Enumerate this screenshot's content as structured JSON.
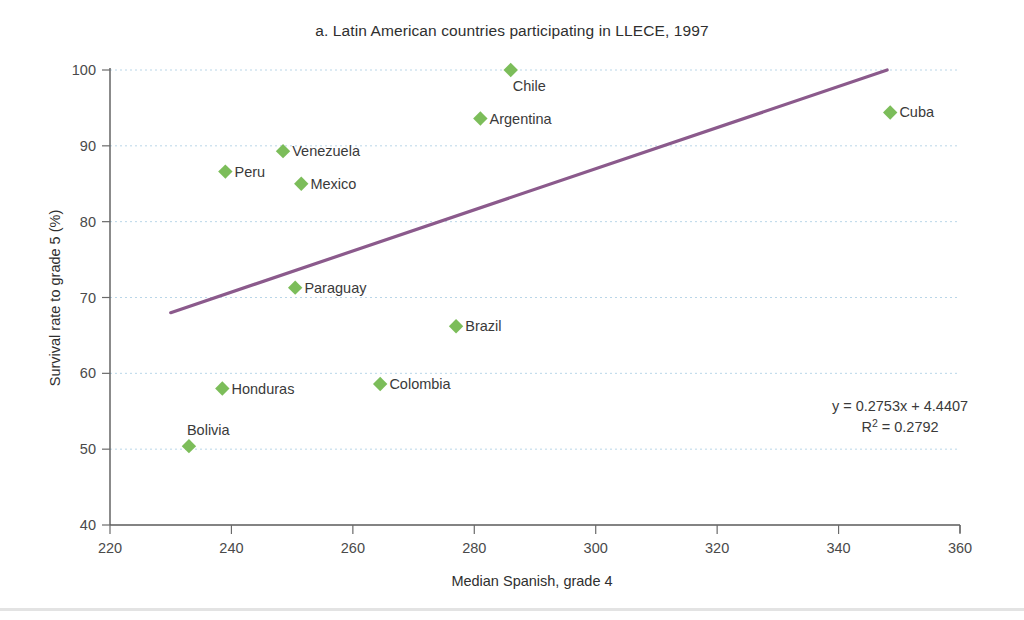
{
  "chart_data": {
    "type": "scatter",
    "title": "a. Latin American countries participating in LLECE, 1997",
    "xlabel": "Median Spanish, grade 4",
    "ylabel": "Survival rate to grade 5 (%)",
    "xlim": [
      220,
      360
    ],
    "ylim": [
      40,
      100
    ],
    "xticks": [
      220,
      240,
      260,
      280,
      300,
      320,
      340,
      360
    ],
    "yticks": [
      40,
      50,
      60,
      70,
      80,
      90,
      100
    ],
    "grid": "horizontal-dotted",
    "legend": "none",
    "marker_shape": "diamond",
    "marker_color": "#7cbd5a",
    "trendline_color": "#8b5a8c",
    "points": [
      {
        "label": "Chile",
        "x": 286.0,
        "y": 100.0,
        "label_pos": "below-right"
      },
      {
        "label": "Argentina",
        "x": 281.0,
        "y": 93.6,
        "label_pos": "right"
      },
      {
        "label": "Venezuela",
        "x": 248.5,
        "y": 89.3,
        "label_pos": "right"
      },
      {
        "label": "Peru",
        "x": 239.0,
        "y": 86.6,
        "label_pos": "right"
      },
      {
        "label": "Mexico",
        "x": 251.5,
        "y": 85.0,
        "label_pos": "right"
      },
      {
        "label": "Paraguay",
        "x": 250.5,
        "y": 71.3,
        "label_pos": "right"
      },
      {
        "label": "Brazil",
        "x": 277.0,
        "y": 66.2,
        "label_pos": "right"
      },
      {
        "label": "Colombia",
        "x": 264.5,
        "y": 58.6,
        "label_pos": "right"
      },
      {
        "label": "Honduras",
        "x": 238.5,
        "y": 58.0,
        "label_pos": "right"
      },
      {
        "label": "Bolivia",
        "x": 233.0,
        "y": 50.4,
        "label_pos": "above-right"
      },
      {
        "label": "Cuba",
        "x": 348.5,
        "y": 94.4,
        "label_pos": "right"
      }
    ],
    "trendline": {
      "equation": "y = 0.2753x + 4.4407",
      "r2_text": "R² = 0.2792",
      "slope": 0.2753,
      "intercept": 4.4407,
      "r_squared": 0.2792,
      "x_start": 230.0,
      "x_end": 348.0,
      "y_start": 68.0,
      "y_end": 100.1
    },
    "annotations": [
      "y = 0.2753x + 4.4407",
      "R² = 0.2792"
    ]
  }
}
